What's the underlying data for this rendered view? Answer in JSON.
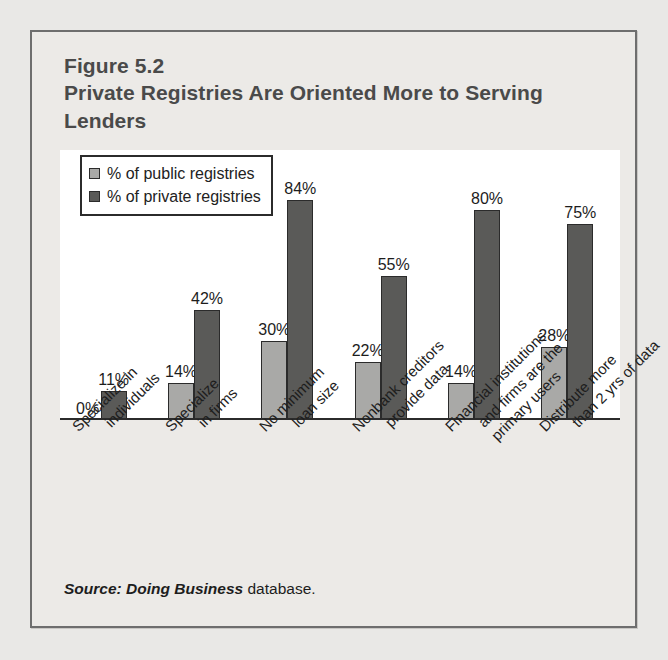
{
  "figure": {
    "number": "Figure 5.2",
    "title": "Private Registries Are Oriented More to Serving Lenders",
    "source_prefix": "Source:",
    "source_italic": "Doing Business",
    "source_suffix": "database."
  },
  "legend": {
    "public_label": "% of public registries",
    "private_label": "% of private registries",
    "public_color": "#a9a9a7",
    "private_color": "#5a5a58"
  },
  "chart_data": {
    "type": "bar",
    "title": "Private Registries Are Oriented More to Serving Lenders",
    "subtitle": "Figure 5.2",
    "xlabel": "",
    "ylabel": "",
    "ylim": [
      0,
      100
    ],
    "grid": false,
    "legend_position": "top-left",
    "categories": [
      "Specialize in individuals",
      "Specialize in firms",
      "No minimum loan size",
      "Nonbank creditors provide data",
      "Financial institutions and firms are the primary users",
      "Distribute more than 2 yrs of data"
    ],
    "category_lines": [
      [
        "Specialize in",
        "individuals"
      ],
      [
        "Specialize",
        "in firms"
      ],
      [
        "No minimum",
        "loan size"
      ],
      [
        "Nonbank creditors",
        "provide data"
      ],
      [
        "Financial institutions",
        "and firms are the",
        "primary users"
      ],
      [
        "Distribute more",
        "than 2 yrs of data"
      ]
    ],
    "series": [
      {
        "name": "% of public registries",
        "color": "#a9a9a7",
        "values": [
          0,
          14,
          30,
          22,
          14,
          28
        ],
        "labels": [
          "0%",
          "14%",
          "30%",
          "22%",
          "14%",
          "28%"
        ]
      },
      {
        "name": "% of private registries",
        "color": "#5a5a58",
        "values": [
          11,
          42,
          84,
          55,
          80,
          75
        ],
        "labels": [
          "11%",
          "42%",
          "84%",
          "55%",
          "80%",
          "75%"
        ]
      }
    ],
    "source": "Source: Doing Business database."
  }
}
